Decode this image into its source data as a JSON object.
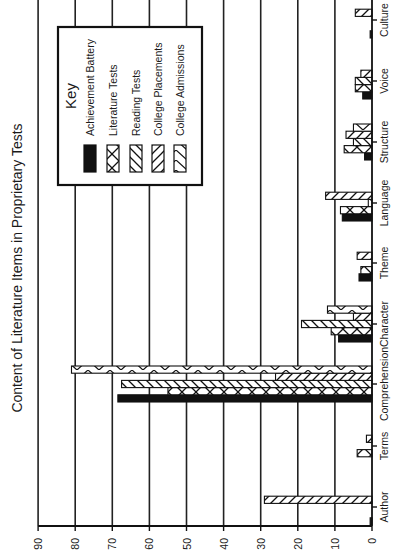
{
  "chart_data": {
    "type": "bar",
    "orientation": "rotated 90 degrees counter-clockwise (value axis runs horizontally along bottom, categories stacked vertically on right)",
    "title": "Content of Literature Items in Proprietary Tests",
    "xlabel": "",
    "ylabel": "",
    "ylim": [
      0,
      90
    ],
    "yticks": [
      0,
      10,
      20,
      30,
      40,
      50,
      60,
      70,
      80,
      90
    ],
    "grid": true,
    "legend_title": "Key",
    "legend_position": "upper area inside plot",
    "categories": [
      "Author",
      "Terms",
      "Comprehension",
      "Character",
      "Theme",
      "Language",
      "Structure",
      "Voice",
      "Culture"
    ],
    "series": [
      {
        "name": "Achievement Battery",
        "pattern": "solid-black",
        "values": [
          0.5,
          0,
          68.5,
          9,
          3.5,
          8,
          2,
          2.5,
          0.5
        ]
      },
      {
        "name": "Literature Tests",
        "pattern": "crosshatch",
        "values": [
          0,
          4,
          55,
          11,
          3,
          8.5,
          7.5,
          4.5,
          0
        ]
      },
      {
        "name": "Reading Tests",
        "pattern": "diagonal-back",
        "values": [
          0,
          0,
          67.5,
          19,
          0,
          1,
          5,
          4.5,
          0
        ]
      },
      {
        "name": "College Placements",
        "pattern": "diagonal-forward",
        "values": [
          29,
          1.5,
          26,
          5,
          4,
          12.5,
          7,
          3,
          4.5
        ]
      },
      {
        "name": "College Admissions",
        "pattern": "x-cross",
        "values": [
          0,
          0,
          81,
          12,
          0,
          0,
          5,
          0,
          0
        ]
      }
    ]
  }
}
